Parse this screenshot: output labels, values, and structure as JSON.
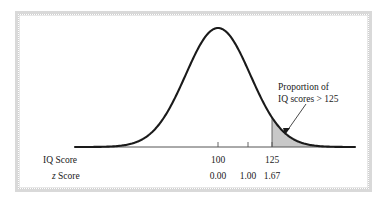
{
  "figure": {
    "title": "",
    "background_color": "#ffffff",
    "frame_color": "#d9d9d9",
    "curve_color": "#1a1a1a",
    "shade_color": "#c8c8c8",
    "axis_color": "#555555"
  },
  "annotation": {
    "line1": "Proportion of",
    "line2": "IQ scores > 125",
    "leader_from": [
      306,
      104
    ],
    "leader_to": [
      285,
      133
    ]
  },
  "row_labels": {
    "iq": "IQ Score",
    "z_italic": "z",
    "z_rest": " Score"
  },
  "chart_data": {
    "type": "area",
    "title": "",
    "subtitle": "",
    "xlabel": "",
    "ylabel": "",
    "distribution": "normal",
    "mean_iq": 100,
    "sd_iq": 15,
    "grid": false,
    "legend_position": "none",
    "ticks": [
      {
        "iq_label": "100",
        "z_label": "0.00",
        "z_value": 0.0,
        "iq_value": 100,
        "x_px": 218
      },
      {
        "iq_label": "",
        "z_label": "1.00",
        "z_value": 1.0,
        "iq_value": 115,
        "x_px": 248
      },
      {
        "iq_label": "125",
        "z_label": "1.67",
        "z_value": 1.67,
        "iq_value": 125,
        "x_px": 272
      }
    ],
    "shaded_region": {
      "from_z": 1.67,
      "to_z": 4.0,
      "from_iq": 125,
      "label": "Proportion of IQ scores > 125",
      "fill": "#c8c8c8"
    },
    "axis_range_z": [
      -4.0,
      4.0
    ],
    "baseline_x_px": [
      75,
      355
    ],
    "peak_x_px": 218,
    "peak_y_px": 28,
    "baseline_y_px": 147
  }
}
